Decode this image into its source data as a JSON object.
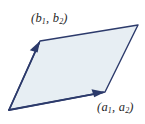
{
  "figure": {
    "background_color": "#ffffff",
    "fill_color": "#e7eef3",
    "stroke_color": "#2c3a6b",
    "stroke_width": 1.4,
    "labels": {
      "vector_a": {
        "text": "(a₁, a₂)",
        "open_paren": "(",
        "first_name": "a",
        "first_sub": "1",
        "separator": ", ",
        "second_name": "a",
        "second_sub": "2",
        "close_paren": ")",
        "x": 97,
        "y": 101
      },
      "vector_b": {
        "text": "(b₁, b₂)",
        "open_paren": "(",
        "first_name": "b",
        "first_sub": "1",
        "separator": ", ",
        "second_name": "b",
        "second_sub": "2",
        "close_paren": ")",
        "x": 31,
        "y": 12
      }
    },
    "geometry": {
      "origin": [
        9,
        110
      ],
      "vertex_a": [
        105,
        92
      ],
      "vertex_b": [
        40,
        41
      ],
      "vertex_sum": [
        138,
        25
      ],
      "polygon_points": "9,110 105,92 138,25 40,41",
      "arrow_a": {
        "from": [
          9,
          110
        ],
        "to": [
          105,
          92
        ],
        "head_tip": [
          105,
          92
        ],
        "head_points": "105,92 92,89.5 94.5,96.5"
      },
      "arrow_b": {
        "from": [
          9,
          110
        ],
        "to": [
          40,
          41
        ],
        "head_tip": [
          40,
          41
        ],
        "head_points": "40,41 30.5,50.5 37.5,52"
      }
    }
  }
}
